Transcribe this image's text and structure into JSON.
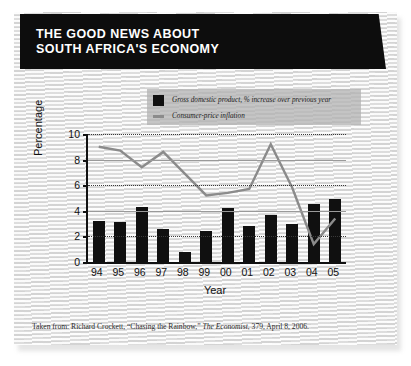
{
  "banner": {
    "line1": "THE GOOD NEWS ABOUT",
    "line2": "SOUTH AFRICA'S ECONOMY"
  },
  "legend": {
    "gdp_label": "Gross domestic product, % increase over previous year",
    "inflation_label": "Consumer-price inflation",
    "gdp_swatch": "black-square-icon",
    "inflation_swatch": "gray-dash-icon"
  },
  "caption": {
    "prefix": "Taken from: Richard Crockett, “Chasing the Rainbow,” ",
    "source": "The Economist",
    "suffix": ", 379, April 8, 2006."
  },
  "colors": {
    "banner_bg": "#0d0d0d",
    "bar": "#101010",
    "line": "#8b8b8b",
    "panel_bg": "#e6e6e6",
    "legend_bg": "#b2b2b2"
  },
  "chart_data": {
    "type": "bar",
    "title": "THE GOOD NEWS ABOUT SOUTH AFRICA'S ECONOMY",
    "xlabel": "Year",
    "ylabel": "Percentage",
    "ylim": [
      0,
      10
    ],
    "yticks": [
      10,
      8,
      6,
      4,
      2,
      0
    ],
    "grid": true,
    "legend_position": "top",
    "categories": [
      "94",
      "95",
      "96",
      "97",
      "98",
      "99",
      "00",
      "01",
      "02",
      "03",
      "04",
      "05"
    ],
    "series": [
      {
        "name": "Gross domestic product, % increase over previous year",
        "type": "bar",
        "color": "#101010",
        "values": [
          3.2,
          3.1,
          4.3,
          2.6,
          0.8,
          2.4,
          4.2,
          2.8,
          3.7,
          3.0,
          4.5,
          4.9
        ]
      },
      {
        "name": "Consumer-price inflation",
        "type": "line",
        "color": "#8b8b8b",
        "values": [
          9.0,
          8.7,
          7.4,
          8.6,
          6.9,
          5.2,
          5.4,
          5.7,
          9.2,
          5.8,
          1.4,
          3.4
        ]
      }
    ]
  }
}
